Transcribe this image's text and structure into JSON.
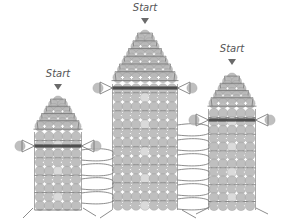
{
  "figure": {
    "type": "beadwork-stitch-diagram",
    "colors": {
      "bead": "#b9b9b9",
      "bead_light": "#d6d6d6",
      "bead_outline": "#9a9a9a",
      "thread": "#6e6e6e",
      "thread_dark": "#3a3a3a",
      "highlight": "#ffffff",
      "label": "#555555"
    },
    "towers": [
      {
        "id": "left",
        "start_label": "Start",
        "label_x": 58,
        "label_y": 68,
        "arrow_y": 84,
        "center_x": 58,
        "bead_size": 9,
        "top_y": 96,
        "step_rows": [
          1,
          2,
          3,
          4
        ],
        "body_cols": 5,
        "body_top": 132,
        "body_rows": 9,
        "dark_band_row": 1,
        "side_loop_y": 146,
        "side_loop_left_x": 20,
        "side_loop_right_x": 96
      },
      {
        "id": "center",
        "start_label": "Start",
        "label_x": 145,
        "label_y": 2,
        "arrow_y": 18,
        "center_x": 145,
        "bead_size": 9,
        "top_y": 30,
        "step_rows": [
          1,
          2,
          3,
          4,
          5,
          6
        ],
        "body_cols": 7,
        "body_top": 84,
        "body_rows": 14,
        "dark_band_row": 0,
        "side_loop_y": 88,
        "side_loop_left_x": 98,
        "side_loop_right_x": 192
      },
      {
        "id": "right",
        "start_label": "Start",
        "label_x": 232,
        "label_y": 43,
        "arrow_y": 59,
        "center_x": 232,
        "bead_size": 9,
        "top_y": 73,
        "step_rows": [
          1,
          2,
          3,
          4
        ],
        "body_cols": 5,
        "body_top": 109,
        "body_rows": 12,
        "dark_band_row": 1,
        "side_loop_y": 120,
        "side_loop_left_x": 194,
        "side_loop_right_x": 270
      }
    ],
    "connecting_loops": [
      {
        "from": "left",
        "to": "center",
        "ys": [
          155,
          170,
          184,
          198
        ]
      },
      {
        "from": "center",
        "to": "right",
        "ys": [
          130,
          145,
          160,
          175,
          190,
          204
        ]
      }
    ],
    "loose_ends": [
      {
        "x1": 33,
        "y1": 208,
        "x2": 23,
        "y2": 218
      },
      {
        "x1": 83,
        "y1": 208,
        "x2": 96,
        "y2": 216
      },
      {
        "x1": 112,
        "y1": 210,
        "x2": 100,
        "y2": 218
      },
      {
        "x1": 182,
        "y1": 210,
        "x2": 196,
        "y2": 218
      },
      {
        "x1": 208,
        "y1": 208,
        "x2": 196,
        "y2": 214
      },
      {
        "x1": 256,
        "y1": 208,
        "x2": 268,
        "y2": 214
      }
    ]
  }
}
